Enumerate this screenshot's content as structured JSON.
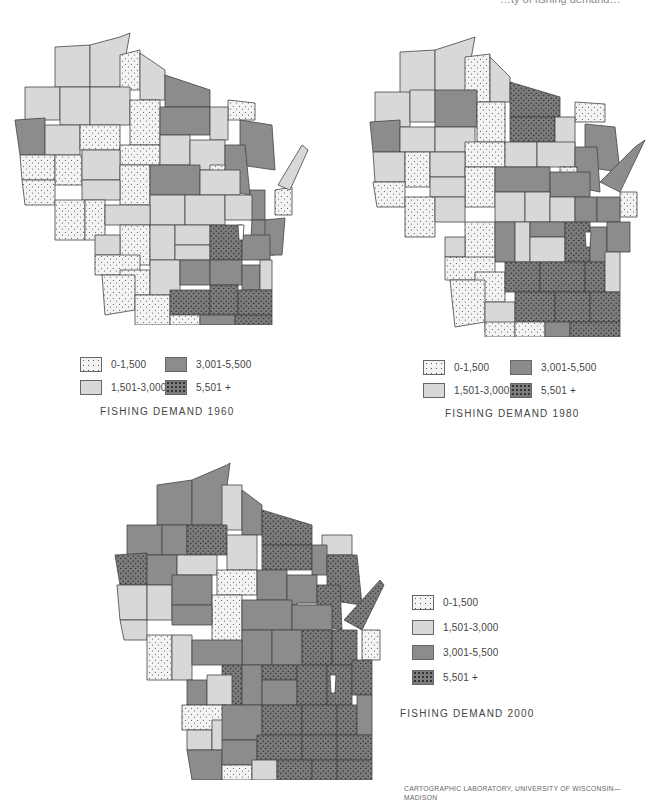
{
  "header": {
    "cutoff_text": "…ty of fishing demand…"
  },
  "legend": {
    "classes": [
      {
        "label": "0-1,500",
        "fill": "dots-light"
      },
      {
        "label": "1,501-3,000",
        "fill": "light-gray"
      },
      {
        "label": "3,001-5,500",
        "fill": "dark-gray"
      },
      {
        "label": "5,501 +",
        "fill": "dots-dark"
      }
    ]
  },
  "maps": [
    {
      "title": "FISHING DEMAND 1960",
      "year": 1960
    },
    {
      "title": "FISHING DEMAND 1980",
      "year": 1980
    },
    {
      "title": "FISHING DEMAND 2000",
      "year": 2000
    }
  ],
  "colors": {
    "light_gray": "#d6d6d6",
    "dark_gray": "#8a8a8a",
    "dots_dark_bg": "#7a7a7a",
    "outline": "#444444"
  },
  "credit": "CARTOGRAPHIC LABORATORY, UNIVERSITY OF WISCONSIN—MADISON"
}
